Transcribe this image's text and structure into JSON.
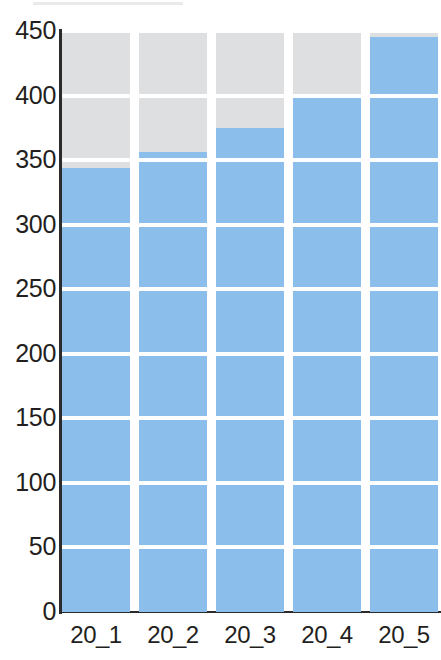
{
  "chart_data": {
    "type": "bar",
    "title": "",
    "subtitle": "",
    "xlabel": "",
    "ylabel": "",
    "categories": [
      "20_1",
      "20_2",
      "20_3",
      "20_4",
      "20_5"
    ],
    "values": [
      344,
      356,
      375,
      399,
      445
    ],
    "series": [
      {
        "name": "value",
        "color": "#8cbeec",
        "values": [
          344,
          356,
          375,
          399,
          445
        ]
      },
      {
        "name": "remainder-to-axis-max",
        "color": "#dedfe0",
        "values": [
          106,
          94,
          75,
          51,
          5
        ]
      }
    ],
    "ylim": [
      0,
      450
    ],
    "yticks": [
      0,
      50,
      100,
      150,
      200,
      250,
      300,
      350,
      400,
      450
    ],
    "ytick_labels": [
      "0",
      "50",
      "100",
      "150",
      "200",
      "250",
      "300",
      "350",
      "400",
      "450"
    ],
    "xtick_labels": [
      "20_1",
      "20_2",
      "20_3",
      "20_4",
      "20_5"
    ],
    "grid": "horizontal-white-lines",
    "legend": "none",
    "legend_position": "none",
    "annotations": [],
    "bar_fill_color": "#8cbeec",
    "bar_track_color": "#dedfe0",
    "gridline_color": "#ffffff",
    "axis_color": "#2b2b2b",
    "background_color": "#ffffff",
    "text_color": "#231f20"
  }
}
